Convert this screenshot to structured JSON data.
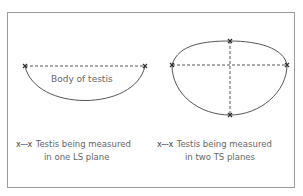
{
  "left_diagram": {
    "label": "Body of testis",
    "legend_key": "x---x",
    "legend_line1": "Testis being measured",
    "legend_line2": "in one LS plane"
  },
  "right_diagram": {
    "legend_key": "x---x",
    "legend_line1": "Testis being measured",
    "legend_line2": "in two TS planes"
  },
  "colors": {
    "outline": "#555555",
    "dashed": "#555555",
    "marker": "#333333",
    "frame": "#9a9a9a"
  }
}
